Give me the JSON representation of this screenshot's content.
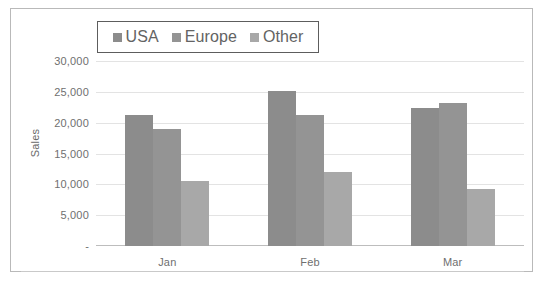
{
  "chart_data": {
    "type": "bar",
    "title": "",
    "subtitle": "",
    "xlabel": "",
    "ylabel": "Sales",
    "categories": [
      "Jan",
      "Feb",
      "Mar"
    ],
    "series": [
      {
        "name": "USA",
        "color": "#8c8c8c",
        "values": [
          21200,
          25100,
          22400
        ]
      },
      {
        "name": "Europe",
        "color": "#949494",
        "values": [
          19000,
          21200,
          23200
        ]
      },
      {
        "name": "Other",
        "color": "#a8a8a8",
        "values": [
          10500,
          12000,
          9300
        ]
      }
    ],
    "ylim": [
      0,
      30000
    ],
    "ytick_values": [
      30000,
      25000,
      20000,
      15000,
      10000,
      5000,
      0
    ],
    "ytick_labels": [
      "30,000",
      "25,000",
      "20,000",
      "15,000",
      "10,000",
      "5,000",
      "-"
    ],
    "grid": true,
    "legend_position": "top",
    "legend_entries": [
      "USA",
      "Europe",
      "Other"
    ],
    "bar_gap_within_group": 0
  },
  "colors": {
    "plot_background": "#ffffff",
    "gridline": "#e3e3e3",
    "axis_line": "#bdbdbd",
    "text": "#6f6f6f",
    "legend_border": "#5d5d5d",
    "chart_border": "#b9b9b9"
  },
  "legend": {
    "items": [
      {
        "label": "USA",
        "swatch": "legend-swatch-usa"
      },
      {
        "label": "Europe",
        "swatch": "legend-swatch-europe"
      },
      {
        "label": "Other",
        "swatch": "legend-swatch-other"
      }
    ]
  },
  "axis": {
    "y_title": "Sales",
    "y_labels": [
      "30,000",
      "25,000",
      "20,000",
      "15,000",
      "10,000",
      "5,000",
      "-"
    ],
    "x_labels": [
      "Jan",
      "Feb",
      "Mar"
    ]
  }
}
